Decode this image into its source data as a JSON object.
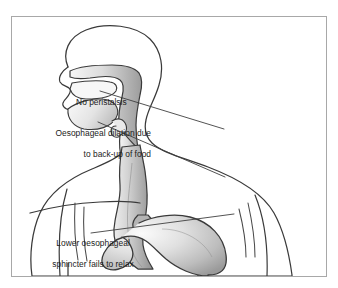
{
  "figure": {
    "title_fragment_above_frame": "",
    "frame": {
      "border_color": "#a8a8a8",
      "background": "#ffffff"
    },
    "condition": "achalasia",
    "colors": {
      "outline": "#3a3a3a",
      "organ_fill_light": "#f4f4f4",
      "organ_fill_mid": "#c9c9c9",
      "organ_fill_dark": "#9d9d9d",
      "body_fill": "#ffffff",
      "leader_line": "#3f3f3f",
      "text": "#1b1b1b"
    }
  },
  "labels": {
    "no_peristalsis": "No peristalsis",
    "dilation_line1": "Oesophageal dilation due",
    "dilation_line2": "to back-up of food",
    "les_line1": "Lower oesophageal",
    "les_line2": "sphincter fails to relax"
  },
  "anatomy_parts": [
    "head-profile",
    "nasal-cavity",
    "oral-cavity",
    "tongue",
    "soft-palate",
    "epiglottis",
    "pharynx",
    "neck",
    "shoulders",
    "left-arm",
    "right-arm",
    "torso",
    "rib-cage-lines",
    "oesophagus-dilated",
    "lower-oesophageal-sphincter",
    "stomach",
    "diaphragm-line"
  ],
  "leader_lines": [
    {
      "name": "leader-no-peristalsis",
      "from": [
        152,
        90
      ],
      "to": [
        223,
        128
      ]
    },
    {
      "name": "leader-dilation",
      "from": [
        150,
        121
      ],
      "to": [
        224,
        176
      ]
    },
    {
      "name": "leader-les",
      "from": [
        143,
        232
      ],
      "to": [
        233,
        213
      ]
    }
  ]
}
